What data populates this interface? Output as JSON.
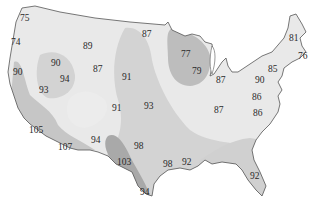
{
  "map": {
    "region": "Contiguous United States",
    "kind": "isotherm temperature map",
    "colors": {
      "background": "#ffffff",
      "land_light": "#e9e9e9",
      "zone_mid": "#d3d3d3",
      "zone_dark": "#bdbdbd",
      "zone_hot": "#a9a9a9",
      "outline": "#555555",
      "lakes": "#ffffff",
      "text": "#2a2a2a"
    },
    "labels": [
      {
        "id": "wa-coast",
        "value": "75",
        "x": 25,
        "y": 18
      },
      {
        "id": "or-coast",
        "value": "74",
        "x": 16,
        "y": 42
      },
      {
        "id": "mt",
        "value": "89",
        "x": 88,
        "y": 46
      },
      {
        "id": "nd",
        "value": "87",
        "x": 147,
        "y": 34
      },
      {
        "id": "mn",
        "value": "77",
        "x": 186,
        "y": 54
      },
      {
        "id": "wi",
        "value": "79",
        "x": 197,
        "y": 71
      },
      {
        "id": "me",
        "value": "81",
        "x": 294,
        "y": 38
      },
      {
        "id": "ma",
        "value": "76",
        "x": 303,
        "y": 56
      },
      {
        "id": "ca-north-coast",
        "value": "90",
        "x": 18,
        "y": 72
      },
      {
        "id": "id-or",
        "value": "90",
        "x": 56,
        "y": 63
      },
      {
        "id": "nv-north",
        "value": "94",
        "x": 65,
        "y": 79
      },
      {
        "id": "wy",
        "value": "87",
        "x": 98,
        "y": 69
      },
      {
        "id": "sd-ne",
        "value": "91",
        "x": 127,
        "y": 77
      },
      {
        "id": "mi",
        "value": "87",
        "x": 221,
        "y": 80
      },
      {
        "id": "ny",
        "value": "85",
        "x": 273,
        "y": 69
      },
      {
        "id": "pa",
        "value": "90",
        "x": 260,
        "y": 80
      },
      {
        "id": "nv-south",
        "value": "93",
        "x": 44,
        "y": 90
      },
      {
        "id": "co-ks",
        "value": "91",
        "x": 117,
        "y": 108
      },
      {
        "id": "ks-mo",
        "value": "93",
        "x": 149,
        "y": 106
      },
      {
        "id": "oh-ky",
        "value": "87",
        "x": 219,
        "y": 110
      },
      {
        "id": "va",
        "value": "86",
        "x": 257,
        "y": 97
      },
      {
        "id": "nc",
        "value": "86",
        "x": 258,
        "y": 113
      },
      {
        "id": "ca-desert",
        "value": "105",
        "x": 34,
        "y": 130
      },
      {
        "id": "az",
        "value": "107",
        "x": 65,
        "y": 147
      },
      {
        "id": "nm",
        "value": "94",
        "x": 96,
        "y": 140
      },
      {
        "id": "ok",
        "value": "98",
        "x": 139,
        "y": 146
      },
      {
        "id": "tx-west",
        "value": "103",
        "x": 123,
        "y": 162
      },
      {
        "id": "la",
        "value": "98",
        "x": 168,
        "y": 164
      },
      {
        "id": "ms",
        "value": "92",
        "x": 187,
        "y": 162
      },
      {
        "id": "fl",
        "value": "92",
        "x": 255,
        "y": 176
      },
      {
        "id": "tx-south",
        "value": "94",
        "x": 145,
        "y": 192
      }
    ]
  }
}
